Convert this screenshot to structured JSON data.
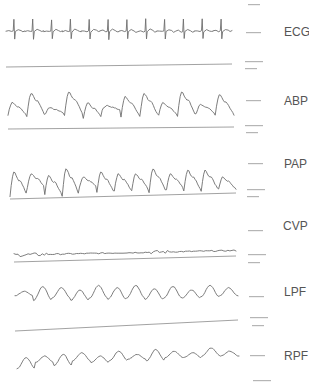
{
  "chart_data": {
    "type": "line",
    "title": "",
    "xlabel": "",
    "ylabel": "",
    "grid": false,
    "legend": "none",
    "channels": [
      {
        "name": "ECG",
        "label": "ECG",
        "kind": "ecg",
        "beats": 12,
        "baseline_drawn": true,
        "relative_values": [
          0,
          0.05,
          -0.1,
          0.9,
          -0.6,
          0.1,
          0.05,
          0.15,
          0.02,
          0
        ]
      },
      {
        "name": "ABP",
        "label": "ABP",
        "kind": "pulsatile",
        "cycles": 12,
        "peaks": [
          0.55,
          0.85,
          0.4,
          0.9,
          0.55,
          0.45,
          0.75,
          0.85,
          0.55,
          0.9,
          0.5,
          0.8
        ],
        "troughs": [
          0.15,
          0.1,
          0.2,
          0.15,
          0.05,
          0.3,
          0.1,
          0.1,
          0.15,
          0.1,
          0.2,
          0.15
        ],
        "baseline_drawn": true
      },
      {
        "name": "PAP",
        "label": "PAP",
        "kind": "pulsatile",
        "cycles": 13,
        "peaks": [
          0.75,
          0.7,
          0.65,
          0.85,
          0.6,
          0.75,
          0.7,
          0.7,
          0.85,
          0.7,
          0.8,
          0.8,
          0.6
        ],
        "troughs": [
          0.05,
          0.3,
          0.1,
          0.05,
          0.3,
          0.15,
          0.2,
          0.2,
          0.15,
          0.25,
          0.2,
          0.2,
          0.25
        ],
        "baseline_drawn": true
      },
      {
        "name": "CVP",
        "label": "CVP",
        "kind": "noise",
        "trend": [
          0.1,
          0.55
        ],
        "baseline_drawn": true
      },
      {
        "name": "LPF",
        "label": "LPF",
        "kind": "smooth",
        "cycles": 12,
        "peaks": [
          0.6,
          0.8,
          0.75,
          0.65,
          0.85,
          0.75,
          0.85,
          0.7,
          0.8,
          0.65,
          0.85,
          0.75
        ],
        "troughs": [
          0.4,
          0.2,
          0.3,
          0.2,
          0.3,
          0.25,
          0.3,
          0.25,
          0.3,
          0.3,
          0.35,
          0.4
        ],
        "baseline_drawn": true
      },
      {
        "name": "RPF",
        "label": "RPF",
        "kind": "smooth",
        "cycles": 12,
        "peaks": [
          0.45,
          0.5,
          0.55,
          0.6,
          0.5,
          0.65,
          0.55,
          0.7,
          0.65,
          0.6,
          0.75,
          0.65
        ],
        "troughs": [
          0.1,
          0.3,
          0.2,
          0.35,
          0.3,
          0.35,
          0.4,
          0.35,
          0.45,
          0.45,
          0.5,
          0.5
        ],
        "baseline_drawn": false
      }
    ]
  },
  "labels": {
    "ecg": "ECG",
    "abp": "ABP",
    "pap": "PAP",
    "cvp": "CVP",
    "lpf": "LPF",
    "rpf": "RPF"
  }
}
